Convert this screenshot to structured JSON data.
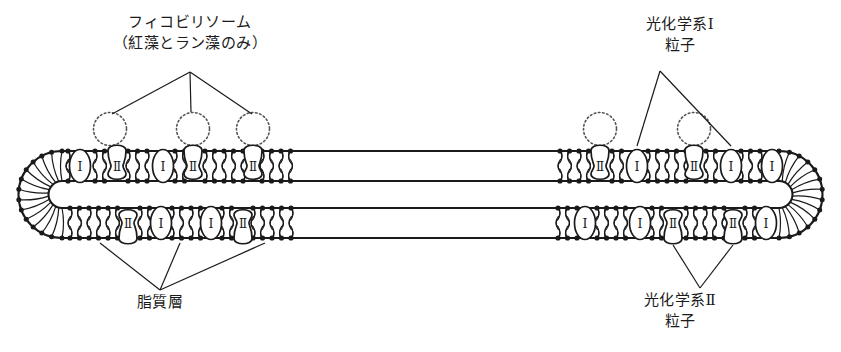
{
  "diagram": {
    "title_note": "thylakoid-membrane-cross-section",
    "stroke_color": "#1a1a1a",
    "fill_color": "#ffffff",
    "dotted_color": "#555555"
  },
  "labels": {
    "phycobilisome": {
      "line1": "フィコビリソーム",
      "line2": "（紅藻とラン藻のみ）"
    },
    "photosystem_1": {
      "line1": "光化学系Ⅰ",
      "line2": "粒子"
    },
    "lipid_layer": {
      "line1": "脂質層",
      "line2": ""
    },
    "photosystem_2": {
      "line1": "光化学系Ⅱ",
      "line2": "粒子"
    }
  },
  "particle_glyphs": {
    "ps1": "Ⅰ",
    "ps2": "Ⅱ"
  },
  "membranes": {
    "top_leaflet": {
      "left_particles": [
        "Ⅰ",
        "Ⅱ",
        "Ⅰ",
        "Ⅱ",
        "Ⅱ"
      ],
      "right_particles": [
        "Ⅱ",
        "Ⅰ",
        "Ⅱ",
        "Ⅰ",
        "Ⅰ"
      ]
    },
    "bottom_leaflet": {
      "left_particles": [
        "Ⅱ",
        "Ⅰ",
        "Ⅰ",
        "Ⅱ"
      ],
      "right_particles": [
        "Ⅰ",
        "Ⅰ",
        "Ⅱ",
        "Ⅱ",
        "Ⅰ"
      ]
    },
    "phycobilisome_count": 3
  }
}
